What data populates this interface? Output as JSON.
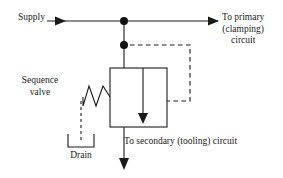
{
  "diagram": {
    "labels": {
      "supply": "Supply",
      "primary_line1": "To primary",
      "primary_line2": "(clamping)",
      "primary_line3": "circuit",
      "sequence_line1": "Sequence",
      "sequence_line2": "valve",
      "drain": "Drain",
      "secondary": "To secondary (tooling) circuit"
    },
    "colors": {
      "line": "#1a1a1a",
      "node": "#111111",
      "text": "#1a1a1a",
      "background": "#ffffff"
    },
    "components": [
      {
        "name": "supply-line",
        "type": "solid-line",
        "style": "solid"
      },
      {
        "name": "supply-arrowhead",
        "type": "arrowhead",
        "direction": "right"
      },
      {
        "name": "primary-arrowhead",
        "type": "arrowhead",
        "direction": "right"
      },
      {
        "name": "junction-dot-supply",
        "type": "junction",
        "x": 124,
        "y": 21
      },
      {
        "name": "junction-dot-pilot",
        "type": "junction",
        "x": 124,
        "y": 45
      },
      {
        "name": "valve-body",
        "type": "rectangle",
        "x": 110,
        "y": 68,
        "width": 57,
        "height": 59
      },
      {
        "name": "valve-flow-path",
        "type": "arrow-line",
        "direction": "down"
      },
      {
        "name": "spring-symbol",
        "type": "zigzag",
        "peaks": 3
      },
      {
        "name": "pilot-line",
        "type": "dashed-line",
        "style": "dashed"
      },
      {
        "name": "drain-line",
        "type": "dashed-line",
        "style": "dashed"
      },
      {
        "name": "drain-bracket",
        "type": "bracket",
        "orientation": "up"
      },
      {
        "name": "secondary-outlet",
        "type": "arrow-line",
        "direction": "down"
      }
    ]
  }
}
